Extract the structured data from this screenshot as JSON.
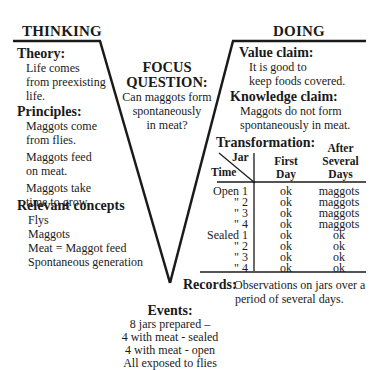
{
  "headings": {
    "thinking": "THINKING",
    "doing": "DOING"
  },
  "focus_question": {
    "title_line1": "FOCUS",
    "title_line2": "QUESTION:",
    "lines": [
      "Can maggots form",
      "spontaneously",
      "in meat?"
    ]
  },
  "thinking": {
    "theory": {
      "title": "Theory:",
      "lines": [
        "Life comes",
        "from preexisting",
        "life."
      ]
    },
    "principles": {
      "title": "Principles:",
      "items": [
        [
          "Maggots come",
          "from flies."
        ],
        [
          "Maggots feed",
          "on meat."
        ],
        [
          "Maggots take",
          "time to grow."
        ]
      ]
    },
    "concepts": {
      "title": "Relevant concepts",
      "items": [
        "Flys",
        "Maggots",
        "Meat = Maggot feed",
        "Spontaneous generation"
      ]
    }
  },
  "doing": {
    "value_claim": {
      "title": "Value claim:",
      "lines": [
        "It is good to",
        "keep foods covered."
      ]
    },
    "knowledge_claim": {
      "title": "Knowledge claim:",
      "lines": [
        "Maggots do not form",
        "spontaneously in meat."
      ]
    },
    "transformation": {
      "title": "Transformation:",
      "header": {
        "jar": "Jar",
        "time": "Time",
        "first_day_line1": "First",
        "first_day_line2": "Day",
        "after_line1": "After",
        "after_line2": "Several",
        "after_line3": "Days"
      },
      "rows": [
        {
          "time": "Open 1",
          "first": "ok",
          "after": "maggots"
        },
        {
          "time": "\"   2",
          "first": "ok",
          "after": "maggots"
        },
        {
          "time": "\"   3",
          "first": "ok",
          "after": "maggots"
        },
        {
          "time": "\"   4",
          "first": "ok",
          "after": "maggots"
        },
        {
          "time": "Sealed 1",
          "first": "ok",
          "after": "ok"
        },
        {
          "time": "\"   2",
          "first": "ok",
          "after": "ok"
        },
        {
          "time": "\"   3",
          "first": "ok",
          "after": "ok"
        },
        {
          "time": "\"   4",
          "first": "ok",
          "after": "ok"
        }
      ]
    },
    "records": {
      "title": "Records:",
      "lines": [
        "Observations on jars over a",
        "period of several days."
      ]
    }
  },
  "events": {
    "title": "Events:",
    "lines": [
      "8 jars prepared –",
      "4 with meat - sealed",
      "4 with meat - open",
      "All exposed to flies"
    ]
  },
  "colors": {
    "ink": "#1a1a1a",
    "background": "#ffffff"
  }
}
